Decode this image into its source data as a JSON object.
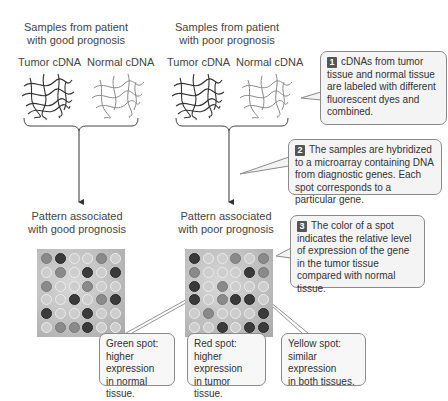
{
  "left_column": {
    "header_line1": "Samples from patient",
    "header_line2": "with good prognosis",
    "tumor_label": "Tumor cDNA",
    "normal_label": "Normal cDNA",
    "pattern_line1": "Pattern associated",
    "pattern_line2": "with good prognosis",
    "grid": [
      [
        "m",
        "d",
        "l",
        "l",
        "m",
        "l"
      ],
      [
        "l",
        "m",
        "l",
        "d",
        "l",
        "d"
      ],
      [
        "m",
        "l",
        "l",
        "m",
        "l",
        "l"
      ],
      [
        "l",
        "l",
        "d",
        "l",
        "m",
        "d"
      ],
      [
        "d",
        "l",
        "l",
        "d",
        "l",
        "l"
      ],
      [
        "l",
        "m",
        "m",
        "d",
        "l",
        "l"
      ]
    ]
  },
  "right_column": {
    "header_line1": "Samples from patient",
    "header_line2": "with poor prognosis",
    "tumor_label": "Tumor cDNA",
    "normal_label": "Normal cDNA",
    "pattern_line1": "Pattern associated",
    "pattern_line2": "with poor prognosis",
    "grid": [
      [
        "d",
        "l",
        "l",
        "m",
        "l",
        "m"
      ],
      [
        "m",
        "l",
        "l",
        "l",
        "d",
        "m"
      ],
      [
        "d",
        "l",
        "m",
        "l",
        "l",
        "l"
      ],
      [
        "d",
        "l",
        "m",
        "d",
        "d",
        "l"
      ],
      [
        "l",
        "m",
        "l",
        "l",
        "l",
        "d"
      ],
      [
        "l",
        "l",
        "d",
        "l",
        "d",
        "d"
      ]
    ]
  },
  "steps": [
    {
      "number": "1",
      "text": "cDNAs from tumor tissue and normal tissue are labeled with different fluorescent dyes and combined."
    },
    {
      "number": "2",
      "text": "The samples are hybridized to a microarray containing DNA from diagnostic genes. Each spot corresponds to a particular gene."
    },
    {
      "number": "3",
      "text": "The color of a spot indicates the relative level of expression of the gene in the tumor tissue compared with normal tissue."
    }
  ],
  "legend": {
    "green": {
      "title": "Green spot:",
      "line2": "higher expression",
      "line3": "in normal tissue."
    },
    "red": {
      "title": "Red spot:",
      "line2": "higher expression",
      "line3": "in tumor tissue."
    },
    "yellow": {
      "title": "Yellow spot:",
      "line2": "similar expression",
      "line3": "in both tissues."
    }
  },
  "colors": {
    "dark_spot": "#3a3a3a",
    "mid_spot": "#8a8a8a",
    "light_spot": "#cdcdcd",
    "box_border": "#8a8a8a",
    "box_fill": "#f4f4f4"
  }
}
